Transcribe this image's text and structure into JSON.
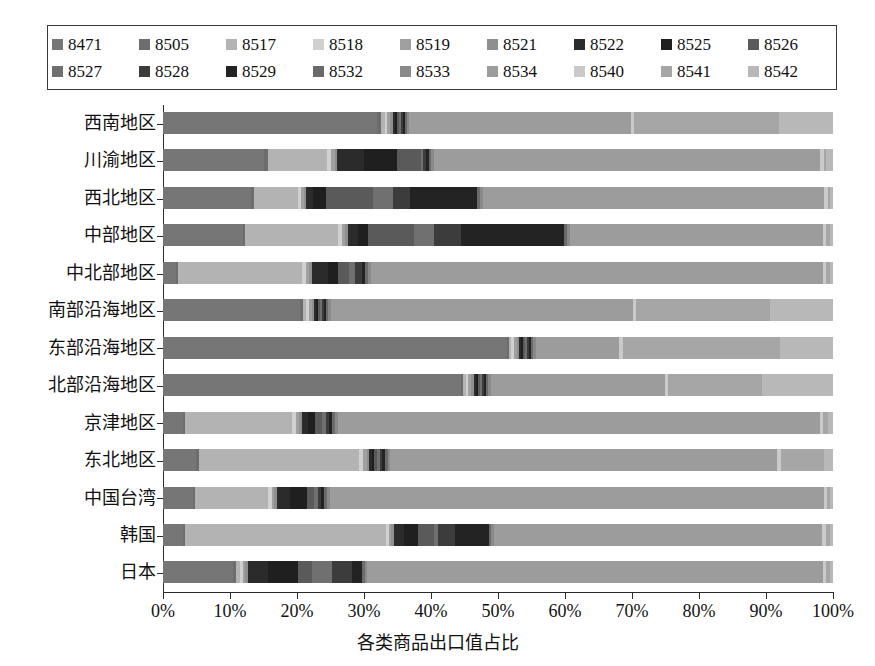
{
  "chart_data": {
    "type": "bar",
    "orientation": "horizontal",
    "stacked": true,
    "title": "",
    "xlabel": "各类商品出口值占比",
    "ylabel": "",
    "xlim": [
      0,
      100
    ],
    "xunit": "%",
    "grid": false,
    "legend_position": "top",
    "xtick_labels": [
      "0%",
      "10%",
      "20%",
      "30%",
      "40%",
      "50%",
      "60%",
      "70%",
      "80%",
      "90%",
      "100%"
    ],
    "xtick_values": [
      0,
      10,
      20,
      30,
      40,
      50,
      60,
      70,
      80,
      90,
      100
    ],
    "categories": [
      "西南地区",
      "川渝地区",
      "西北地区",
      "中部地区",
      "中北部地区",
      "南部沿海地区",
      "东部沿海地区",
      "北部沿海地区",
      "京津地区",
      "东北地区",
      "中国台湾",
      "韩国",
      "日本"
    ],
    "series": [
      {
        "name": "8471",
        "color": "#767676",
        "values": [
          32.0,
          15.2,
          13.2,
          12.0,
          2.0,
          20.5,
          51.5,
          44.5,
          3.0,
          5.0,
          4.5,
          3.0,
          10.5
        ]
      },
      {
        "name": "8505",
        "color": "#6d6d6d",
        "values": [
          0.6,
          0.5,
          0.4,
          0.3,
          0.2,
          0.4,
          0.3,
          0.3,
          0.3,
          0.4,
          0.3,
          0.3,
          0.4
        ]
      },
      {
        "name": "8517",
        "color": "#b3b3b3",
        "values": [
          0.5,
          9.0,
          6.5,
          14.0,
          18.5,
          0.5,
          0.4,
          0.4,
          16.0,
          24.0,
          11.0,
          30.0,
          0.6
        ]
      },
      {
        "name": "8518",
        "color": "#d0d0d0",
        "values": [
          0.4,
          0.6,
          0.5,
          0.5,
          0.6,
          0.4,
          0.4,
          0.4,
          0.5,
          0.6,
          0.5,
          0.4,
          0.4
        ]
      },
      {
        "name": "8519",
        "color": "#a0a0a0",
        "values": [
          0.4,
          0.5,
          0.4,
          0.5,
          0.5,
          0.4,
          0.4,
          0.4,
          0.5,
          0.5,
          0.4,
          0.4,
          0.4
        ]
      },
      {
        "name": "8521",
        "color": "#8f8f8f",
        "values": [
          0.4,
          0.4,
          0.4,
          0.4,
          0.4,
          0.4,
          0.4,
          0.4,
          0.4,
          0.4,
          0.4,
          0.4,
          0.4
        ]
      },
      {
        "name": "8522",
        "color": "#2b2b2b",
        "values": [
          0.3,
          4.0,
          1.0,
          1.5,
          2.5,
          0.3,
          0.3,
          0.3,
          1.0,
          0.4,
          2.0,
          1.5,
          3.0
        ]
      },
      {
        "name": "8525",
        "color": "#1f1f1f",
        "values": [
          0.3,
          5.0,
          2.0,
          1.5,
          1.5,
          0.3,
          0.3,
          0.3,
          1.0,
          0.4,
          2.5,
          2.0,
          4.5
        ]
      },
      {
        "name": "8526",
        "color": "#5a5a5a",
        "values": [
          0.3,
          3.5,
          7.0,
          7.0,
          1.5,
          0.3,
          0.3,
          0.3,
          1.0,
          0.4,
          1.0,
          2.5,
          2.0
        ]
      },
      {
        "name": "8527",
        "color": "#707070",
        "values": [
          0.3,
          0.4,
          3.0,
          3.0,
          1.0,
          0.3,
          0.3,
          0.3,
          0.6,
          0.4,
          0.6,
          0.6,
          3.0
        ]
      },
      {
        "name": "8528",
        "color": "#3c3c3c",
        "values": [
          0.3,
          0.4,
          2.5,
          4.0,
          1.0,
          0.3,
          0.3,
          0.3,
          0.5,
          0.4,
          0.5,
          2.5,
          3.0
        ]
      },
      {
        "name": "8529",
        "color": "#232323",
        "values": [
          0.3,
          0.4,
          10.0,
          15.5,
          0.5,
          0.3,
          0.3,
          0.3,
          0.5,
          0.4,
          0.5,
          5.0,
          1.5
        ]
      },
      {
        "name": "8532",
        "color": "#6a6a6a",
        "values": [
          0.3,
          0.4,
          0.4,
          0.4,
          0.4,
          0.3,
          0.3,
          0.3,
          0.4,
          0.4,
          0.4,
          0.4,
          0.4
        ]
      },
      {
        "name": "8533",
        "color": "#8a8a8a",
        "values": [
          0.4,
          0.4,
          0.4,
          0.4,
          0.4,
          0.4,
          0.4,
          0.4,
          0.4,
          0.4,
          0.4,
          0.4,
          0.4
        ]
      },
      {
        "name": "8534",
        "color": "#9c9c9c",
        "values": [
          33.0,
          58.0,
          51.0,
          38.0,
          67.5,
          45.0,
          12.5,
          26.0,
          72.0,
          58.0,
          74.0,
          49.0,
          68.0
        ]
      },
      {
        "name": "8540",
        "color": "#cacaca",
        "values": [
          0.5,
          0.5,
          0.5,
          0.5,
          0.5,
          0.5,
          0.5,
          0.5,
          0.5,
          0.5,
          0.5,
          0.5,
          0.5
        ]
      },
      {
        "name": "8541",
        "color": "#a6a6a6",
        "values": [
          21.7,
          0.4,
          0.4,
          0.5,
          0.5,
          20.0,
          23.5,
          14.0,
          0.6,
          6.5,
          0.5,
          0.6,
          0.5
        ]
      },
      {
        "name": "8542",
        "color": "#b8b8b8",
        "values": [
          8.0,
          1.0,
          0.4,
          0.5,
          0.5,
          9.4,
          8.0,
          10.6,
          0.8,
          1.3,
          0.4,
          0.5,
          0.5
        ]
      }
    ]
  },
  "legend": {
    "row1": [
      {
        "label": "8471",
        "color": "#767676"
      },
      {
        "label": "8505",
        "color": "#6d6d6d"
      },
      {
        "label": "8517",
        "color": "#b3b3b3"
      },
      {
        "label": "8518",
        "color": "#d0d0d0"
      },
      {
        "label": "8519",
        "color": "#a0a0a0"
      },
      {
        "label": "8521",
        "color": "#8f8f8f"
      },
      {
        "label": "8522",
        "color": "#2b2b2b"
      },
      {
        "label": "8525",
        "color": "#1f1f1f"
      },
      {
        "label": "8526",
        "color": "#5a5a5a"
      }
    ],
    "row2": [
      {
        "label": "8527",
        "color": "#707070"
      },
      {
        "label": "8528",
        "color": "#3c3c3c"
      },
      {
        "label": "8529",
        "color": "#232323"
      },
      {
        "label": "8532",
        "color": "#6a6a6a"
      },
      {
        "label": "8533",
        "color": "#8a8a8a"
      },
      {
        "label": "8534",
        "color": "#9c9c9c"
      },
      {
        "label": "8540",
        "color": "#cacaca"
      },
      {
        "label": "8541",
        "color": "#a6a6a6"
      },
      {
        "label": "8542",
        "color": "#b8b8b8"
      }
    ]
  }
}
